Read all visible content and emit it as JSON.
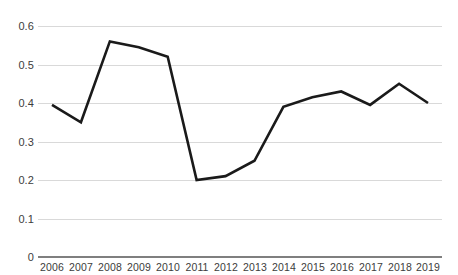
{
  "chart_data": {
    "type": "line",
    "title": "",
    "subtitle": "",
    "xlabel": "",
    "ylabel": "",
    "categories": [
      "2006",
      "2007",
      "2008",
      "2009",
      "2010",
      "2011",
      "2012",
      "2013",
      "2014",
      "2015",
      "2016",
      "2017",
      "2018",
      "2019"
    ],
    "series": [
      {
        "name": "series-1",
        "values": [
          0.395,
          0.35,
          0.56,
          0.545,
          0.52,
          0.2,
          0.21,
          0.25,
          0.39,
          0.415,
          0.43,
          0.395,
          0.45,
          0.4
        ],
        "color": "#1a1a1a"
      }
    ],
    "ylim": [
      0,
      0.6
    ],
    "yticks": [
      0,
      0.1,
      0.2,
      0.3,
      0.4,
      0.5,
      0.6
    ],
    "ytick_labels": [
      "0",
      "0.1",
      "0.2",
      "0.3",
      "0.4",
      "0.5",
      "0.6"
    ],
    "grid": "horizontal",
    "grid_color": "#d9d9d9",
    "legend": "none",
    "legend_position": "none",
    "annotations": [],
    "axis_color": "#7f7f7f",
    "tick_label_color": "#3c3c3c",
    "background_color": "#ffffff"
  }
}
